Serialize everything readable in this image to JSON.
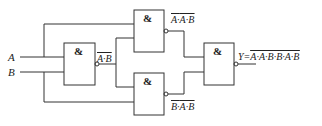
{
  "diagram": {
    "type": "logic-circuit",
    "inputs": [
      {
        "name": "A"
      },
      {
        "name": "B"
      }
    ],
    "gates": [
      {
        "id": "g1",
        "symbol": "&",
        "type": "NAND",
        "output_label": "A·B"
      },
      {
        "id": "g2",
        "symbol": "&",
        "type": "NAND",
        "output_label": "A·A·B"
      },
      {
        "id": "g3",
        "symbol": "&",
        "type": "NAND",
        "output_label": "B·A·B"
      },
      {
        "id": "g4",
        "symbol": "&",
        "type": "NAND",
        "output_label": "Y=A·A·B·B·A·B"
      }
    ],
    "labels": {
      "a": "A",
      "b": "B",
      "amp": "&",
      "g1_out": "A·B",
      "g2_out_a": "A·",
      "g2_out_b": "A·B",
      "g3_out_a": "B·",
      "g3_out_b": "A·B",
      "y_prefix": "Y=",
      "y_a1": "A·",
      "y_a2": "A·B",
      "y_sep": "·",
      "y_b1": "B·",
      "y_b2": "A·B"
    },
    "colors": {
      "line": "#333333",
      "text": "#222222",
      "background": "#ffffff"
    }
  }
}
